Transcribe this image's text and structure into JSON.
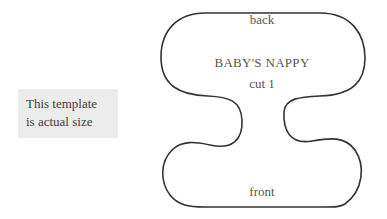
{
  "note": {
    "line1": "This template",
    "line2": "is actual size",
    "background": "#ececec"
  },
  "pattern": {
    "name": "BABY'S NAPPY",
    "instruction": "cut 1",
    "top_label": "back",
    "bottom_label": "front",
    "outline_color": "#333333",
    "text_color": "#555555"
  }
}
